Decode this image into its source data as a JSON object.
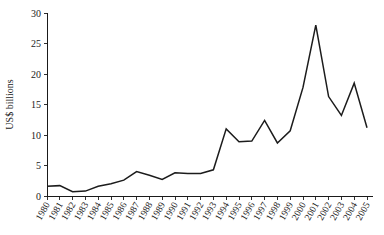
{
  "chart_data": {
    "type": "line",
    "title": "",
    "xlabel": "",
    "ylabel": "US$ billions",
    "categories": [
      "1980",
      "1981",
      "1982",
      "1983",
      "1984",
      "1985",
      "1986",
      "1987",
      "1988",
      "1989",
      "1990",
      "1991",
      "1992",
      "1993",
      "1994",
      "1995",
      "1996",
      "1997",
      "1998",
      "1999",
      "2000",
      "2001",
      "2002",
      "2003",
      "2004",
      "2005"
    ],
    "values": [
      1.6,
      1.7,
      0.7,
      0.8,
      1.6,
      2.0,
      2.6,
      4.0,
      3.4,
      2.7,
      3.8,
      3.7,
      3.7,
      4.3,
      11.0,
      8.9,
      9.0,
      12.4,
      8.7,
      10.7,
      17.8,
      28.0,
      16.3,
      13.2,
      18.5,
      11.2
    ],
    "ylim": [
      0,
      30
    ],
    "yticks": [
      0,
      5,
      10,
      15,
      20,
      25,
      30
    ],
    "ytick_labels": [
      "0",
      "5",
      "10",
      "15",
      "20",
      "25",
      "30"
    ],
    "grid": false,
    "legend": null,
    "series": [
      {
        "name": "US$ billions",
        "values": [
          1.6,
          1.7,
          0.7,
          0.8,
          1.6,
          2.0,
          2.6,
          4.0,
          3.4,
          2.7,
          3.8,
          3.7,
          3.7,
          4.3,
          11.0,
          8.9,
          9.0,
          12.4,
          8.7,
          10.7,
          17.8,
          28.0,
          16.3,
          13.2,
          18.5,
          11.2
        ],
        "color": "#1c1c1c"
      }
    ]
  },
  "colors": {
    "line": "#1c1c1c",
    "axis": "#1a1a1a",
    "background": "#ffffff"
  }
}
